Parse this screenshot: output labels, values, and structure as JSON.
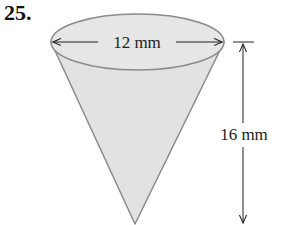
{
  "problem": {
    "number": "25."
  },
  "figure": {
    "shape": "cone",
    "diameter_label": "12 mm",
    "height_label": "16 mm",
    "fill_color": "#e4e4e4",
    "edge_color": "#8a8a8a"
  }
}
